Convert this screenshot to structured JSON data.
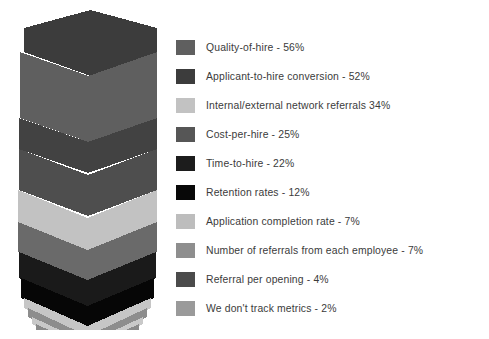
{
  "chart_data": {
    "type": "pie",
    "chart_style": "stacked-chevron-funnel-pyramid",
    "title": "",
    "subtitle": "",
    "xlabel": "",
    "ylabel": "",
    "grid": false,
    "legend_position": "right",
    "value_unit": "%",
    "categories": [
      "Quality-of-hire",
      "Applicant-to-hire conversion",
      "Internal/external network referrals",
      "Cost-per-hire",
      "Time-to-hire",
      "Retention rates",
      "Application completion rate",
      "Number of referrals from each employee",
      "Referral per opening",
      "We don't track metrics"
    ],
    "values": [
      56,
      52,
      34,
      25,
      22,
      12,
      7,
      7,
      4,
      2
    ],
    "colors": [
      "#5f5f5f",
      "#3c3c3c",
      "#c2c2c2",
      "#565656",
      "#1c1c1c",
      "#080808",
      "#bdbdbd",
      "#8e8e8e",
      "#4b4b4b",
      "#9a9a9a"
    ],
    "series": [
      {
        "name": "Share of respondents",
        "values": [
          56,
          52,
          34,
          25,
          22,
          12,
          7,
          7,
          4,
          2
        ]
      }
    ]
  },
  "legend": {
    "rows": [
      {
        "label": "Quality-of-hire - 56%",
        "color": "#5f5f5f"
      },
      {
        "label": "Applicant-to-hire conversion - 52%",
        "color": "#3c3c3c"
      },
      {
        "label": "Internal/external network referrals   34%",
        "color": "#c2c2c2"
      },
      {
        "label": "Cost-per-hire - 25%",
        "color": "#565656"
      },
      {
        "label": "Time-to-hire - 22%",
        "color": "#1c1c1c"
      },
      {
        "label": "Retention rates - 12%",
        "color": "#080808"
      },
      {
        "label": "Application completion rate - 7%",
        "color": "#bdbdbd"
      },
      {
        "label": "Number of referrals from each employee - 7%",
        "color": "#8e8e8e"
      },
      {
        "label": "Referral per opening - 4%",
        "color": "#4b4b4b"
      },
      {
        "label": "We don't track metrics - 2%",
        "color": "#9a9a9a"
      }
    ]
  },
  "funnel": {
    "bands": [
      {
        "name": "quality-of-hire",
        "color": "#3c3c3c",
        "top": 0,
        "bottom": 42,
        "left": 6,
        "right": 139,
        "notch": 24
      },
      {
        "name": "applicant-to-hire",
        "color": "#5f5f5f",
        "top": 42,
        "bottom": 108,
        "left": 2,
        "right": 139,
        "notch": 24
      },
      {
        "name": "network-referrals-band",
        "color": "#424242",
        "top": 108,
        "bottom": 139,
        "left": 1,
        "right": 139,
        "notch": 24
      },
      {
        "name": "cost-per-hire",
        "color": "#4e4e4e",
        "top": 139,
        "bottom": 180,
        "left": 1,
        "right": 139,
        "notch": 26
      },
      {
        "name": "internal-external-referrals",
        "color": "#c2c2c2",
        "top": 180,
        "bottom": 212,
        "left": 0,
        "right": 139,
        "notch": 28
      },
      {
        "name": "time-to-hire",
        "color": "#6a6a6a",
        "top": 212,
        "bottom": 242,
        "left": 0,
        "right": 139,
        "notch": 28
      },
      {
        "name": "retention-rates-dark",
        "color": "#1a1a1a",
        "top": 242,
        "bottom": 268,
        "left": 1,
        "right": 138,
        "notch": 28
      },
      {
        "name": "retention-rates-black",
        "color": "#060606",
        "top": 268,
        "bottom": 288,
        "left": 3,
        "right": 136,
        "notch": 28
      },
      {
        "name": "application-completion",
        "color": "#c6c6c6",
        "top": 288,
        "bottom": 298,
        "left": 6,
        "right": 133,
        "notch": 28
      },
      {
        "name": "number-of-referrals",
        "color": "#8d8d8d",
        "top": 298,
        "bottom": 307,
        "left": 10,
        "right": 129,
        "notch": 28
      },
      {
        "name": "referral-per-opening",
        "color": "#c9c9c9",
        "top": 307,
        "bottom": 314,
        "left": 14,
        "right": 125,
        "notch": 26
      },
      {
        "name": "we-dont-track-metrics",
        "color": "#8a8a8a",
        "top": 314,
        "bottom": 320,
        "left": 18,
        "right": 121,
        "notch": 24
      }
    ]
  }
}
